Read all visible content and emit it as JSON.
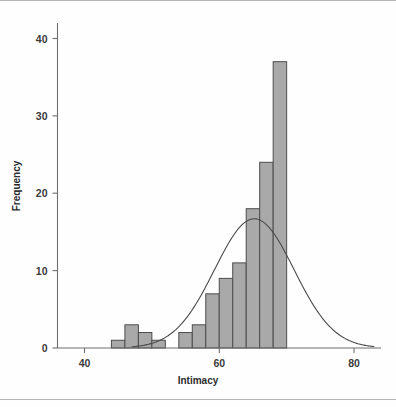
{
  "chart_data": {
    "type": "bar",
    "title": "",
    "subtitle": "",
    "xlabel": "Intimacy",
    "ylabel": "Frequency",
    "xlim": [
      36,
      84
    ],
    "ylim": [
      0,
      42
    ],
    "xticks": [
      40,
      60,
      80
    ],
    "yticks": [
      0,
      10,
      20,
      30,
      40
    ],
    "xtick_labels": [
      "40",
      "60",
      "80"
    ],
    "ytick_labels": [
      "0",
      "10",
      "20",
      "30",
      "40"
    ],
    "grid": false,
    "legend": false,
    "bin_width": 2,
    "bin_starts": [
      44,
      46,
      48,
      50,
      54,
      56,
      58,
      60,
      62,
      64,
      66,
      68,
      70,
      72
    ],
    "categories": [
      "44-46",
      "46-48",
      "48-50",
      "50-52",
      "54-56",
      "56-58",
      "58-60",
      "60-62",
      "62-64",
      "64-66",
      "66-68",
      "68-70",
      "70-72",
      "72-74"
    ],
    "values": [
      1,
      3,
      2,
      1,
      2,
      3,
      3,
      7,
      9,
      11,
      18,
      24,
      37,
      0
    ],
    "bars": [
      {
        "x0": 44,
        "x1": 46,
        "value": 1
      },
      {
        "x0": 46,
        "x1": 48,
        "value": 3
      },
      {
        "x0": 48,
        "x1": 50,
        "value": 2
      },
      {
        "x0": 50,
        "x1": 52,
        "value": 1
      },
      {
        "x0": 54,
        "x1": 56,
        "value": 2
      },
      {
        "x0": 56,
        "x1": 58,
        "value": 3
      },
      {
        "x0": 58,
        "x1": 60,
        "value": 7
      },
      {
        "x0": 60,
        "x1": 62,
        "value": 9
      },
      {
        "x0": 62,
        "x1": 64,
        "value": 11
      },
      {
        "x0": 64,
        "x1": 66,
        "value": 18
      },
      {
        "x0": 66,
        "x1": 68,
        "value": 24
      },
      {
        "x0": 68,
        "x1": 70,
        "value": 37
      }
    ],
    "overlay_curve": {
      "type": "normal",
      "mean": 65.2,
      "std": 5.9,
      "peak_value": 16.7,
      "x_start": 47,
      "x_end": 83
    },
    "colors": {
      "bar_fill": "#a9a9a9",
      "bar_edge": "#4d4d4d",
      "curve": "#4a4a4a",
      "axis": "#6e6e6e",
      "text": "#2b2b2b",
      "background": "#ffffff"
    }
  },
  "figure": {
    "axis_label_x": "Intimacy",
    "axis_label_y": "Frequency"
  }
}
